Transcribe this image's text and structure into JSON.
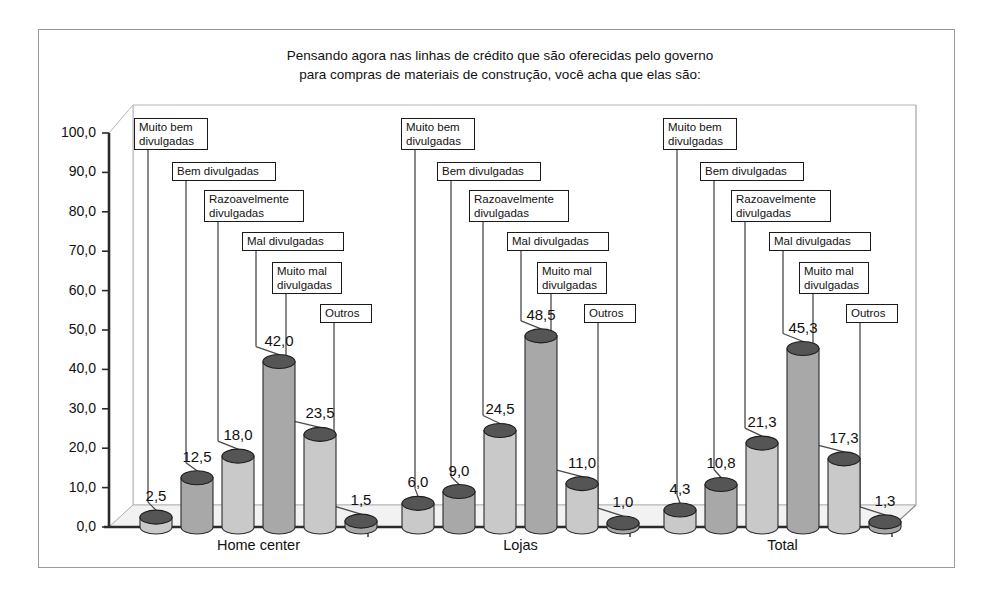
{
  "title": "Pensando agora nas linhas de crédito que são oferecidas pelo governo\npara compras de materiais de construção, você acha que elas são:",
  "chart_data": {
    "type": "bar",
    "title": "Pensando agora nas linhas de crédito que são oferecidas pelo governo para compras de materiais de construção, você acha que elas são:",
    "xlabel": "",
    "ylabel": "",
    "ylim": [
      0,
      100
    ],
    "ytick_labels": [
      "0,0",
      "10,0",
      "20,0",
      "30,0",
      "40,0",
      "50,0",
      "60,0",
      "70,0",
      "80,0",
      "90,0",
      "100,0"
    ],
    "ytick_values": [
      0,
      10,
      20,
      30,
      40,
      50,
      60,
      70,
      80,
      90,
      100
    ],
    "grid": false,
    "legend": "none",
    "categories": [
      "Home center",
      "Lojas",
      "Total"
    ],
    "series": [
      {
        "name": "Muito bem divulgadas",
        "values": [
          2.5,
          6.0,
          4.3
        ],
        "labels": [
          "2,5",
          "6,0",
          "4,3"
        ]
      },
      {
        "name": "Bem divulgadas",
        "values": [
          12.5,
          9.0,
          10.8
        ],
        "labels": [
          "12,5",
          "9,0",
          "10,8"
        ]
      },
      {
        "name": "Razoavelmente divulgadas",
        "values": [
          18.0,
          24.5,
          21.3
        ],
        "labels": [
          "18,0",
          "24,5",
          "21,3"
        ]
      },
      {
        "name": "Mal divulgadas",
        "values": [
          42.0,
          48.5,
          45.3
        ],
        "labels": [
          "42,0",
          "48,5",
          "45,3"
        ]
      },
      {
        "name": "Muito mal divulgadas",
        "values": [
          23.5,
          11.0,
          17.3
        ],
        "labels": [
          "23,5",
          "11,0",
          "17,3"
        ]
      },
      {
        "name": "Outros",
        "values": [
          1.5,
          1.0,
          1.3
        ],
        "labels": [
          "1,5",
          "1,0",
          "1,3"
        ]
      }
    ],
    "series_callout_labels": [
      "Muito bem\ndivulgadas",
      "Bem divulgadas",
      "Razoavelmente\ndivulgadas",
      "Mal divulgadas",
      "Muito mal\ndivulgadas",
      "Outros"
    ],
    "colors": {
      "bar_light": "#c9c9c9",
      "bar_medium": "#a8a8a8",
      "bar_top": "#555555",
      "axis": "#2b2b2b",
      "frame": "#9a9a9a",
      "floor": "#e8e8e8",
      "background": "#ffffff"
    }
  }
}
